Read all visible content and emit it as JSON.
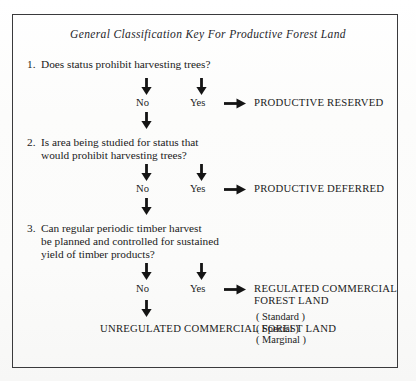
{
  "document": {
    "title": "General Classification Key For Productive Forest Land"
  },
  "questions": [
    {
      "number": "1.",
      "lines": [
        "Does status prohibit harvesting trees?"
      ]
    },
    {
      "number": "2.",
      "lines": [
        "Is area being studied for status that",
        "would prohibit harvesting trees?"
      ]
    },
    {
      "number": "3.",
      "lines": [
        "Can regular periodic timber harvest",
        "be planned and controlled for sustained",
        "yield of timber products?"
      ]
    }
  ],
  "branches": {
    "no_label": "No",
    "yes_label": "Yes"
  },
  "outcomes": {
    "productive_reserved": [
      "PRODUCTIVE  RESERVED"
    ],
    "productive_deferred": [
      "PRODUCTIVE  DEFERRED"
    ],
    "regulated_commercial": [
      "REGULATED  COMMERCIAL",
      "FOREST  LAND"
    ],
    "regulated_subtypes": [
      "( Standard )",
      "( Special )",
      "( Marginal )"
    ],
    "unregulated_commercial": [
      "UNREGULATED",
      "COMMERCIAL",
      "FOREST  LAND"
    ]
  },
  "icons": {
    "arrow_down": "arrow-down-icon",
    "arrow_right": "arrow-right-icon"
  },
  "colors": {
    "ink": "#1b1b1b",
    "frame": "#3a3a3c",
    "paper": "#fdfdfc"
  }
}
